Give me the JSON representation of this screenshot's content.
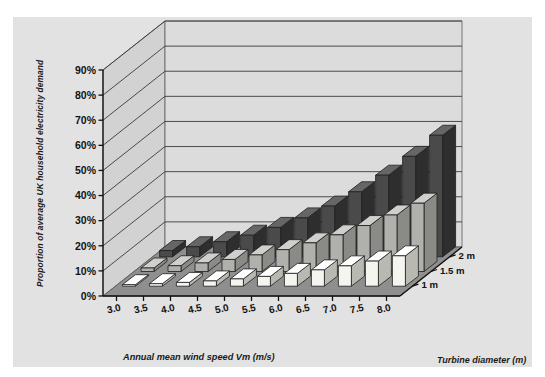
{
  "figure": {
    "background": "#ffffff",
    "panel_background": "#e2e2e2"
  },
  "chart_data": {
    "type": "bar",
    "subtype": "3d-grouped-bar",
    "title": "",
    "xlabel": "Annual mean wind speed Vm (m/s)",
    "ylabel": "Proportion of average UK household electricity demand",
    "zlabel": "Turbine diameter (m)",
    "categories": [
      "3.0",
      "3.5",
      "4.0",
      "4.5",
      "5.0",
      "5.5",
      "6.0",
      "6.5",
      "7.0",
      "7.5",
      "8.0"
    ],
    "ytick_labels": [
      "0%",
      "10%",
      "20%",
      "30%",
      "40%",
      "50%",
      "60%",
      "70%",
      "80%",
      "90%"
    ],
    "ytick_values": [
      0,
      10,
      20,
      30,
      40,
      50,
      60,
      70,
      80,
      90
    ],
    "ylim": [
      0,
      90
    ],
    "grid": true,
    "legend_position": "right-axis",
    "series": [
      {
        "name": "1 m",
        "color": "#f5f5f0",
        "side_color": "#b9b9b2",
        "top_color": "#ffffff",
        "values": [
          0.6,
          1.0,
          1.5,
          2.1,
          2.9,
          3.9,
          5.1,
          6.5,
          8.1,
          10.0,
          12.1
        ]
      },
      {
        "name": "1.5 m",
        "color": "#b0b0ad",
        "side_color": "#8a8a87",
        "top_color": "#cfcfcc",
        "values": [
          1.4,
          2.3,
          3.4,
          4.8,
          6.6,
          8.7,
          11.4,
          14.6,
          18.3,
          22.5,
          27.2
        ]
      },
      {
        "name": "2 m",
        "color": "#4a4a4a",
        "side_color": "#2e2e2e",
        "top_color": "#666666",
        "values": [
          2.5,
          4.0,
          6.0,
          8.6,
          11.7,
          15.5,
          20.2,
          25.9,
          32.5,
          40.0,
          48.4
        ]
      }
    ],
    "series_order_back_to_front": [
      "2 m",
      "1.5 m",
      "1 m"
    ]
  }
}
